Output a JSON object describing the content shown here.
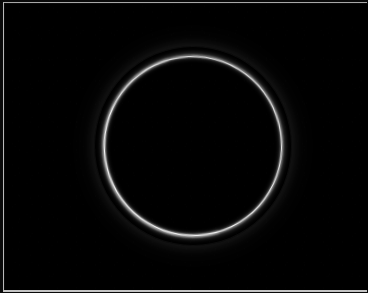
{
  "image": {
    "kind": "photograph",
    "subject": "glowing-circular-ring",
    "caption": "A thin, bright white glowing circular ring photographed against a completely black background",
    "width": 368,
    "height": 293
  },
  "background": {
    "name": "black-field",
    "color": "#000000",
    "description": "Uniform pure black field filling the frame"
  },
  "frame": {
    "name": "print-border",
    "description": "Thin light gray border line along the left, top and bottom edges of the print",
    "border_color": "#bcbcbc",
    "outer_margin_color": "#0a0a0a",
    "edges_visible": "left, top, bottom"
  },
  "ring": {
    "name": "light-ring",
    "shape": "circle",
    "stroke_color": "#ffffff",
    "glow_color": "#ffffff",
    "center_x": 193,
    "center_y": 146,
    "radius_x": 88,
    "radius_y": 89,
    "stroke_width_px": 3,
    "interior_color": "#000000",
    "notes": "Slightly irregular, hand-formed hoop; lower-left arc reads marginally brighter and thicker than the upper-right arc"
  },
  "palette": {
    "black": "#000000",
    "white": "#ffffff",
    "border_gray": "#bcbcbc",
    "margin_gray": "#0a0a0a"
  }
}
